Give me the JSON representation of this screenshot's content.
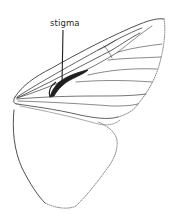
{
  "figure": {
    "labels": [
      {
        "id": "stigma",
        "text": "stigma",
        "x": 50,
        "y": 19
      }
    ]
  },
  "colors": {
    "background": "#ffffff",
    "line": "#3a3a3a",
    "stigma_fill": "#1e1e1e",
    "dotted_margin": "#7a7a7a"
  }
}
